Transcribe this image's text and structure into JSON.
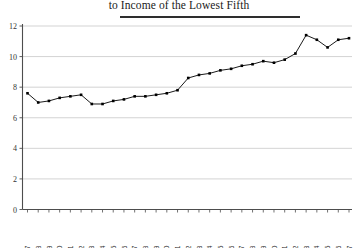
{
  "chart_data": {
    "type": "line",
    "title": "to Income of the Lowest Fifth",
    "xlabel": "",
    "ylabel": "",
    "xlim": [
      1966.5,
      1997.5
    ],
    "ylim": [
      0,
      12
    ],
    "grid": true,
    "grid_axis": "y",
    "legend": "none",
    "marker": "filled-square",
    "line_color": "#000000",
    "marker_color": "#000000",
    "x": [
      1967,
      1968,
      1969,
      1970,
      1971,
      1972,
      1973,
      1974,
      1975,
      1976,
      1977,
      1978,
      1979,
      1980,
      1981,
      1982,
      1983,
      1984,
      1985,
      1986,
      1987,
      1988,
      1989,
      1990,
      1991,
      1992,
      1993,
      1994,
      1995,
      1996,
      1997
    ],
    "values": [
      7.6,
      7.0,
      7.1,
      7.3,
      7.4,
      7.5,
      6.9,
      6.9,
      7.1,
      7.2,
      7.4,
      7.4,
      7.5,
      7.6,
      7.8,
      8.6,
      8.8,
      8.9,
      9.1,
      9.2,
      9.4,
      9.5,
      9.7,
      9.6,
      9.8,
      10.2,
      11.4,
      11.1,
      10.6,
      11.1,
      11.2
    ],
    "yticks": [
      0,
      2,
      4,
      6,
      8,
      10,
      12
    ],
    "ytick_labels": [
      "0",
      "2",
      "4",
      "6",
      "8",
      "10",
      "12"
    ],
    "xtick_labels": [
      "1967",
      "1968",
      "1969",
      "1970",
      "1971",
      "1972",
      "1973",
      "1974",
      "1975",
      "1976",
      "1977",
      "1978",
      "1979",
      "1980",
      "1981",
      "1982",
      "1983",
      "1984",
      "1985",
      "1986",
      "1987",
      "1988",
      "1989",
      "1990",
      "1991",
      "1992",
      "1993",
      "1994",
      "1995",
      "1996",
      "1997"
    ],
    "xtick_rotation": -90,
    "colors": {
      "axis": "#4d4d4d",
      "grid": "#c8c8c8",
      "title_rule": "#2e2e2e",
      "background": "#ffffff"
    }
  }
}
